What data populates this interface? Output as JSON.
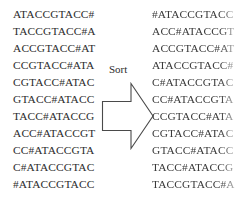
{
  "figure": {
    "operation_label": "Sort",
    "arrow_icon": "block-arrow-right-icon",
    "text_color": "#2d2d2d",
    "background_color": "#ffffff"
  },
  "unsorted": {
    "caption": "",
    "rows": [
      "ATACCGTACC#",
      "TACCGTACC#A",
      "ACCGTACC#AT",
      "CCGTACC#ATA",
      "CGTACC#ATAC",
      "GTACC#ATACC",
      "TACC#ATACCG",
      "ACC#ATACCGT",
      "CC#ATACCGTA",
      "C#ATACCGTAC",
      "#ATACCGTACC"
    ]
  },
  "sorted": {
    "caption": "",
    "rows": [
      "#ATACCGTACC",
      "ACC#ATACCGT",
      "ACCGTACC#AT",
      "ATACCGTACC#",
      "C#ATACCGTAC",
      "CC#ATACCGTA",
      "CCGTACC#ATA",
      "CGTACC#ATAC",
      "GTACC#ATACC",
      "TACC#ATACCG",
      "TACCGTACC#A"
    ]
  }
}
